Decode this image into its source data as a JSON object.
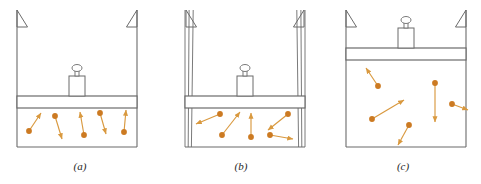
{
  "figure": {
    "background_color": "#ffffff",
    "line_color": "#6b6b6b",
    "particle_color": "#cc7a22",
    "arrow_color": "#d9993f",
    "caption_color": "#262626",
    "panels": [
      {
        "id": "a",
        "caption": "(a)",
        "caption_x": 80,
        "caption_y": 170,
        "cylinder": {
          "x": 17,
          "y": 10,
          "width": 120,
          "height": 137
        },
        "piston": {
          "x": 17,
          "y": 96,
          "width": 120,
          "height": 12
        },
        "weight": {
          "body": {
            "x": 69,
            "y": 76,
            "width": 16,
            "height": 20
          },
          "knob_stem": {
            "x": 75,
            "y": 70,
            "width": 4,
            "height": 6
          },
          "knob_top": {
            "cx": 77,
            "cy": 68,
            "rx": 5,
            "ry": 3.5
          }
        },
        "hatch_marks": [
          {
            "side": "left",
            "x": 17,
            "y_top": 10,
            "size": 17
          },
          {
            "side": "right",
            "x": 137,
            "y_top": 10,
            "size": 17
          }
        ],
        "wall_style": "single",
        "particles": [
          {
            "cx": 29,
            "cy": 131,
            "ax": 41,
            "ay": 113
          },
          {
            "cx": 55,
            "cy": 116,
            "ax": 62,
            "ay": 139
          },
          {
            "cx": 84,
            "cy": 135,
            "ax": 80,
            "ay": 112
          },
          {
            "cx": 100,
            "cy": 113,
            "ax": 106,
            "ay": 134
          },
          {
            "cx": 124,
            "cy": 132,
            "ax": 126,
            "ay": 110
          }
        ]
      },
      {
        "id": "b",
        "caption": "(b)",
        "caption_x": 241,
        "caption_y": 170,
        "cylinder": {
          "x": 185,
          "y": 10,
          "width": 120,
          "height": 137
        },
        "piston": {
          "x": 185,
          "y": 96,
          "width": 120,
          "height": 12
        },
        "weight": {
          "body": {
            "x": 237,
            "y": 76,
            "width": 16,
            "height": 20
          },
          "knob_stem": {
            "x": 243,
            "y": 70,
            "width": 4,
            "height": 6
          },
          "knob_top": {
            "cx": 245,
            "cy": 68,
            "rx": 5,
            "ry": 3.5
          }
        },
        "hatch_marks": [
          {
            "side": "left",
            "x": 186,
            "y_top": 10,
            "size": 17
          },
          {
            "side": "right",
            "x": 304,
            "y_top": 10,
            "size": 17
          }
        ],
        "wall_style": "triple",
        "particles": [
          {
            "cx": 220,
            "cy": 114,
            "ax": 196,
            "ay": 124
          },
          {
            "cx": 222,
            "cy": 135,
            "ax": 240,
            "ay": 112
          },
          {
            "cx": 251,
            "cy": 137,
            "ax": 251,
            "ay": 113
          },
          {
            "cx": 288,
            "cy": 114,
            "ax": 268,
            "ay": 130
          },
          {
            "cx": 270,
            "cy": 135,
            "ax": 293,
            "ay": 139
          }
        ]
      },
      {
        "id": "c",
        "caption": "(c)",
        "caption_x": 403,
        "caption_y": 170,
        "cylinder": {
          "x": 346,
          "y": 10,
          "width": 120,
          "height": 137
        },
        "piston": {
          "x": 346,
          "y": 48,
          "width": 120,
          "height": 12
        },
        "weight": {
          "body": {
            "x": 398,
            "y": 28,
            "width": 16,
            "height": 20
          },
          "knob_stem": {
            "x": 404,
            "y": 22,
            "width": 4,
            "height": 6
          },
          "knob_top": {
            "cx": 406,
            "cy": 20,
            "rx": 5,
            "ry": 3.5
          }
        },
        "hatch_marks": [
          {
            "side": "left",
            "x": 346,
            "y_top": 10,
            "size": 17
          },
          {
            "side": "right",
            "x": 466,
            "y_top": 10,
            "size": 17
          }
        ],
        "wall_style": "single",
        "particles": [
          {
            "cx": 378,
            "cy": 86,
            "ax": 366,
            "ay": 68
          },
          {
            "cx": 372,
            "cy": 119,
            "ax": 404,
            "ay": 100
          },
          {
            "cx": 409,
            "cy": 125,
            "ax": 398,
            "ay": 145
          },
          {
            "cx": 435,
            "cy": 83,
            "ax": 435,
            "ay": 122
          },
          {
            "cx": 452,
            "cy": 104,
            "ax": 468,
            "ay": 110
          }
        ]
      }
    ]
  }
}
